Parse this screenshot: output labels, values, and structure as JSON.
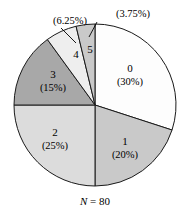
{
  "chart_data": {
    "type": "pie",
    "title": "",
    "subtitle": "",
    "caption": "N = 80",
    "caption_symbol": "N",
    "caption_rest": " = 80",
    "total_n": 80,
    "start_angle_deg": 0,
    "direction": "clockwise",
    "legend": "none",
    "grid": false,
    "categories": [
      "0",
      "1",
      "2",
      "3",
      "4",
      "5"
    ],
    "values": [
      30,
      20,
      25,
      15,
      6.25,
      3.75
    ],
    "counts": [
      24,
      16,
      20,
      12,
      5,
      3
    ],
    "slices": [
      {
        "category": "0",
        "label": "0",
        "percent_label": "(30%)",
        "percent": 30,
        "color": "#fdfdfd",
        "start_deg": 0,
        "end_deg": 108,
        "label_mode": "inside",
        "label_x": 130,
        "label_y": 72,
        "percent_x": 130,
        "percent_y": 85
      },
      {
        "category": "1",
        "label": "1",
        "percent_label": "(20%)",
        "percent": 20,
        "color": "#c9c9c9",
        "start_deg": 108,
        "end_deg": 180,
        "label_mode": "inside",
        "label_x": 125,
        "label_y": 145,
        "percent_x": 125,
        "percent_y": 158
      },
      {
        "category": "2",
        "label": "2",
        "percent_label": "(25%)",
        "percent": 25,
        "color": "#dcdcdc",
        "start_deg": 180,
        "end_deg": 270,
        "label_mode": "inside",
        "label_x": 55,
        "label_y": 136,
        "percent_x": 55,
        "percent_y": 149
      },
      {
        "category": "3",
        "label": "3",
        "percent_label": "(15%)",
        "percent": 15,
        "color": "#a8a8a8",
        "start_deg": 270,
        "end_deg": 324,
        "label_mode": "inside",
        "label_x": 53,
        "label_y": 78,
        "percent_x": 53,
        "percent_y": 91
      },
      {
        "category": "4",
        "label": "4",
        "percent_label": "(6.25%)",
        "percent": 6.25,
        "color": "#eeeeee",
        "start_deg": 324,
        "end_deg": 346.5,
        "label_mode": "callout",
        "label_x": 76,
        "label_y": 58,
        "callout_x": 42,
        "callout_y": 24,
        "leader_x1": 61,
        "leader_y1": 28,
        "leader_x2": 76,
        "leader_y2": 43
      },
      {
        "category": "5",
        "label": "5",
        "percent_label": "(3.75%)",
        "percent": 3.75,
        "color": "#c9c9c9",
        "start_deg": 346.5,
        "end_deg": 360,
        "label_mode": "callout",
        "label_x": 90,
        "label_y": 53,
        "callout_x": 105,
        "callout_y": 17,
        "leader_x1": 97,
        "leader_y1": 22,
        "leader_x2": 89,
        "leader_y2": 37
      }
    ],
    "geometry": {
      "center_x": 95,
      "center_y": 105,
      "radius": 81
    },
    "colors": {
      "outline": "#1a1a1a",
      "background": "#ffffff",
      "text": "#000000"
    }
  }
}
